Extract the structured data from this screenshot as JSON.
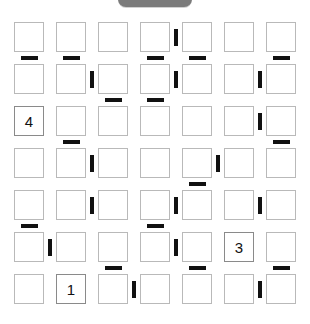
{
  "window": {
    "title": "Puzzle Grid",
    "background_color": "#ffffff"
  },
  "top_handle": {
    "name": "top-pill-handle",
    "color": "#7b7b7b",
    "label": ""
  },
  "grid": {
    "rows": 7,
    "columns": 7,
    "cell_size": 30,
    "border_color": "#b9b9b9",
    "given_border_color": "#8a8a8a",
    "mark_color": "#111111",
    "origin_x": 14,
    "origin_y": 22,
    "step_x": 42,
    "step_y": 42,
    "cells": [
      [
        {
          "r": 0,
          "c": 0,
          "value": ""
        },
        {
          "r": 0,
          "c": 1,
          "value": ""
        },
        {
          "r": 0,
          "c": 2,
          "value": ""
        },
        {
          "r": 0,
          "c": 3,
          "value": ""
        },
        {
          "r": 0,
          "c": 4,
          "value": ""
        },
        {
          "r": 0,
          "c": 5,
          "value": ""
        },
        {
          "r": 0,
          "c": 6,
          "value": ""
        }
      ],
      [
        {
          "r": 1,
          "c": 0,
          "value": ""
        },
        {
          "r": 1,
          "c": 1,
          "value": ""
        },
        {
          "r": 1,
          "c": 2,
          "value": ""
        },
        {
          "r": 1,
          "c": 3,
          "value": ""
        },
        {
          "r": 1,
          "c": 4,
          "value": ""
        },
        {
          "r": 1,
          "c": 5,
          "value": ""
        },
        {
          "r": 1,
          "c": 6,
          "value": ""
        }
      ],
      [
        {
          "r": 2,
          "c": 0,
          "value": "4"
        },
        {
          "r": 2,
          "c": 1,
          "value": ""
        },
        {
          "r": 2,
          "c": 2,
          "value": ""
        },
        {
          "r": 2,
          "c": 3,
          "value": ""
        },
        {
          "r": 2,
          "c": 4,
          "value": ""
        },
        {
          "r": 2,
          "c": 5,
          "value": ""
        },
        {
          "r": 2,
          "c": 6,
          "value": ""
        }
      ],
      [
        {
          "r": 3,
          "c": 0,
          "value": ""
        },
        {
          "r": 3,
          "c": 1,
          "value": ""
        },
        {
          "r": 3,
          "c": 2,
          "value": ""
        },
        {
          "r": 3,
          "c": 3,
          "value": ""
        },
        {
          "r": 3,
          "c": 4,
          "value": ""
        },
        {
          "r": 3,
          "c": 5,
          "value": ""
        },
        {
          "r": 3,
          "c": 6,
          "value": ""
        }
      ],
      [
        {
          "r": 4,
          "c": 0,
          "value": ""
        },
        {
          "r": 4,
          "c": 1,
          "value": ""
        },
        {
          "r": 4,
          "c": 2,
          "value": ""
        },
        {
          "r": 4,
          "c": 3,
          "value": ""
        },
        {
          "r": 4,
          "c": 4,
          "value": ""
        },
        {
          "r": 4,
          "c": 5,
          "value": ""
        },
        {
          "r": 4,
          "c": 6,
          "value": ""
        }
      ],
      [
        {
          "r": 5,
          "c": 0,
          "value": ""
        },
        {
          "r": 5,
          "c": 1,
          "value": ""
        },
        {
          "r": 5,
          "c": 2,
          "value": ""
        },
        {
          "r": 5,
          "c": 3,
          "value": ""
        },
        {
          "r": 5,
          "c": 4,
          "value": ""
        },
        {
          "r": 5,
          "c": 5,
          "value": "3"
        },
        {
          "r": 5,
          "c": 6,
          "value": ""
        }
      ],
      [
        {
          "r": 6,
          "c": 0,
          "value": ""
        },
        {
          "r": 6,
          "c": 1,
          "value": "1"
        },
        {
          "r": 6,
          "c": 2,
          "value": ""
        },
        {
          "r": 6,
          "c": 3,
          "value": ""
        },
        {
          "r": 6,
          "c": 4,
          "value": ""
        },
        {
          "r": 6,
          "c": 5,
          "value": ""
        },
        {
          "r": 6,
          "c": 6,
          "value": ""
        }
      ]
    ],
    "horizontal_marks": [
      {
        "row_gap": 0,
        "col": 0
      },
      {
        "row_gap": 0,
        "col": 1
      },
      {
        "row_gap": 0,
        "col": 3
      },
      {
        "row_gap": 0,
        "col": 4
      },
      {
        "row_gap": 0,
        "col": 6
      },
      {
        "row_gap": 1,
        "col": 2
      },
      {
        "row_gap": 1,
        "col": 3
      },
      {
        "row_gap": 2,
        "col": 1
      },
      {
        "row_gap": 2,
        "col": 6
      },
      {
        "row_gap": 3,
        "col": 4
      },
      {
        "row_gap": 4,
        "col": 0
      },
      {
        "row_gap": 4,
        "col": 3
      },
      {
        "row_gap": 5,
        "col": 2
      },
      {
        "row_gap": 5,
        "col": 4
      },
      {
        "row_gap": 5,
        "col": 6
      }
    ],
    "vertical_marks": [
      {
        "row": 0,
        "col_gap": 3
      },
      {
        "row": 1,
        "col_gap": 1
      },
      {
        "row": 1,
        "col_gap": 3
      },
      {
        "row": 1,
        "col_gap": 5
      },
      {
        "row": 2,
        "col_gap": 5
      },
      {
        "row": 3,
        "col_gap": 1
      },
      {
        "row": 3,
        "col_gap": 4
      },
      {
        "row": 4,
        "col_gap": 1
      },
      {
        "row": 4,
        "col_gap": 3
      },
      {
        "row": 4,
        "col_gap": 5
      },
      {
        "row": 5,
        "col_gap": 0
      },
      {
        "row": 5,
        "col_gap": 3
      },
      {
        "row": 6,
        "col_gap": 2
      },
      {
        "row": 6,
        "col_gap": 5
      }
    ]
  }
}
